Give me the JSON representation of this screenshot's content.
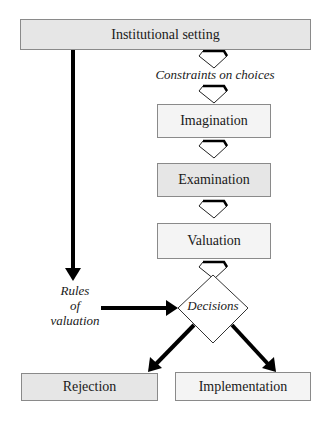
{
  "diagram": {
    "nodes": {
      "institutional_setting": "Institutional setting",
      "imagination": "Imagination",
      "examination": "Examination",
      "valuation": "Valuation",
      "decisions": "Decisions",
      "rejection": "Rejection",
      "implementation": "Implementation"
    },
    "labels": {
      "constraints": "Constraints on choices",
      "rules_line1": "Rules",
      "rules_line2": "of",
      "rules_line3": "valuation"
    },
    "colors": {
      "shaded_fill": "#e6e6e6",
      "light_fill": "#f4f4f4",
      "border": "#8a8a8a",
      "arrow": "#000000"
    }
  }
}
